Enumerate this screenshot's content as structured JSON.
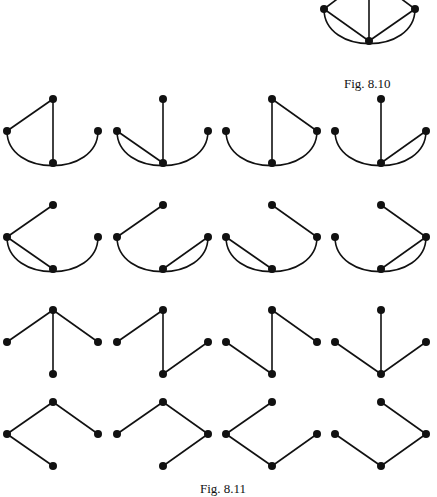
{
  "figures": [
    {
      "caption": "Fig. 8.10",
      "description": "Complete graph K4-like: three outer vertices joined to a central bottom vertex, outer left and right joined by curved arc",
      "nodes": {
        "T": [
          369,
          -25
        ],
        "L": [
          324,
          9
        ],
        "R": [
          415,
          9
        ],
        "B": [
          369,
          41
        ]
      },
      "edges": [
        [
          "L",
          "T"
        ],
        [
          "R",
          "T"
        ],
        [
          "T",
          "B"
        ],
        [
          "L",
          "B"
        ],
        [
          "R",
          "B"
        ]
      ],
      "arcs": [
        [
          "L",
          "R"
        ]
      ]
    },
    {
      "caption": "Fig. 8.11",
      "description": "The 16 spanning trees of the graph in Fig. 8.10",
      "base_nodes": {
        "T": [
          53,
          0
        ],
        "L": [
          7,
          32
        ],
        "R": [
          98,
          32
        ],
        "B": [
          53,
          64
        ]
      },
      "column_offsets": [
        0,
        110,
        219,
        328
      ],
      "row_offsets": [
        99,
        205,
        310,
        402
      ],
      "spanning_trees": [
        {
          "row": 0,
          "col": 0,
          "edges": [
            [
              "L",
              "T"
            ],
            [
              "T",
              "B"
            ]
          ],
          "arc": true
        },
        {
          "row": 0,
          "col": 1,
          "edges": [
            [
              "L",
              "B"
            ],
            [
              "T",
              "B"
            ]
          ],
          "arc": true
        },
        {
          "row": 0,
          "col": 2,
          "edges": [
            [
              "T",
              "R"
            ],
            [
              "T",
              "B"
            ]
          ],
          "arc": true
        },
        {
          "row": 0,
          "col": 3,
          "edges": [
            [
              "T",
              "B"
            ],
            [
              "R",
              "B"
            ]
          ],
          "arc": true
        },
        {
          "row": 1,
          "col": 0,
          "edges": [
            [
              "L",
              "T"
            ],
            [
              "L",
              "B"
            ]
          ],
          "arc": true
        },
        {
          "row": 1,
          "col": 1,
          "edges": [
            [
              "L",
              "T"
            ],
            [
              "R",
              "B"
            ]
          ],
          "arc": true
        },
        {
          "row": 1,
          "col": 2,
          "edges": [
            [
              "T",
              "R"
            ],
            [
              "L",
              "B"
            ]
          ],
          "arc": true
        },
        {
          "row": 1,
          "col": 3,
          "edges": [
            [
              "T",
              "R"
            ],
            [
              "R",
              "B"
            ]
          ],
          "arc": true
        },
        {
          "row": 2,
          "col": 0,
          "edges": [
            [
              "L",
              "T"
            ],
            [
              "T",
              "R"
            ],
            [
              "T",
              "B"
            ]
          ],
          "arc": false
        },
        {
          "row": 2,
          "col": 1,
          "edges": [
            [
              "L",
              "T"
            ],
            [
              "T",
              "B"
            ],
            [
              "B",
              "R"
            ]
          ],
          "arc": false
        },
        {
          "row": 2,
          "col": 2,
          "edges": [
            [
              "L",
              "B"
            ],
            [
              "T",
              "B"
            ],
            [
              "T",
              "R"
            ]
          ],
          "arc": false
        },
        {
          "row": 2,
          "col": 3,
          "edges": [
            [
              "L",
              "B"
            ],
            [
              "T",
              "B"
            ],
            [
              "R",
              "B"
            ]
          ],
          "arc": false
        },
        {
          "row": 3,
          "col": 0,
          "edges": [
            [
              "L",
              "T"
            ],
            [
              "T",
              "R"
            ],
            [
              "L",
              "B"
            ]
          ],
          "arc": false
        },
        {
          "row": 3,
          "col": 1,
          "edges": [
            [
              "L",
              "T"
            ],
            [
              "T",
              "R"
            ],
            [
              "R",
              "B"
            ]
          ],
          "arc": false
        },
        {
          "row": 3,
          "col": 2,
          "edges": [
            [
              "L",
              "T"
            ],
            [
              "L",
              "B"
            ],
            [
              "B",
              "R"
            ]
          ],
          "arc": false
        },
        {
          "row": 3,
          "col": 3,
          "edges": [
            [
              "L",
              "B"
            ],
            [
              "B",
              "R"
            ],
            [
              "R",
              "T"
            ]
          ],
          "arc": false
        }
      ]
    }
  ],
  "style": {
    "ink": "#111111",
    "background": "#ffffff",
    "node_radius": 4
  }
}
